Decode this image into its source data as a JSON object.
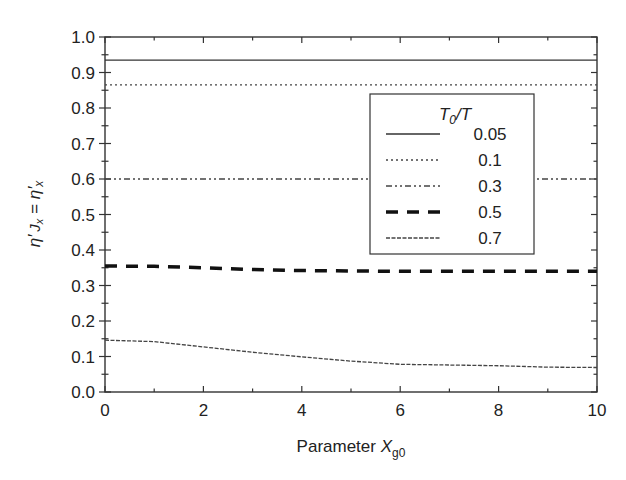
{
  "chart_data": {
    "type": "line",
    "title": "",
    "xlabel": "Parameter X_g0",
    "xlabel_main": "Parameter ",
    "xlabel_var": "X",
    "xlabel_sub": "g0",
    "ylabel": "η′_Jx = η′_x",
    "xlim": [
      0,
      10
    ],
    "ylim": [
      0.0,
      1.0
    ],
    "xticks": [
      0,
      2,
      4,
      6,
      8,
      10
    ],
    "xtick_labels": [
      "0",
      "2",
      "4",
      "6",
      "8",
      "10"
    ],
    "yticks": [
      0.0,
      0.1,
      0.2,
      0.3,
      0.4,
      0.5,
      0.6,
      0.7,
      0.8,
      0.9,
      1.0
    ],
    "ytick_labels": [
      "0.0",
      "0.1",
      "0.2",
      "0.3",
      "0.4",
      "0.5",
      "0.6",
      "0.7",
      "0.8",
      "0.9",
      "1.0"
    ],
    "grid": false,
    "legend_title": "T0/T",
    "legend_position": "upper right (inside)",
    "x": [
      0,
      1,
      2,
      3,
      4,
      5,
      6,
      7,
      8,
      9,
      10
    ],
    "series": [
      {
        "name": "0.05",
        "style": "solid",
        "values": [
          0.935,
          0.935,
          0.935,
          0.935,
          0.935,
          0.935,
          0.935,
          0.935,
          0.935,
          0.935,
          0.935
        ]
      },
      {
        "name": "0.1",
        "style": "dotted",
        "values": [
          0.865,
          0.865,
          0.865,
          0.865,
          0.865,
          0.865,
          0.865,
          0.865,
          0.865,
          0.865,
          0.865
        ]
      },
      {
        "name": "0.3",
        "style": "dash-dot-dot",
        "values": [
          0.6,
          0.6,
          0.6,
          0.6,
          0.6,
          0.6,
          0.6,
          0.6,
          0.6,
          0.6,
          0.6
        ]
      },
      {
        "name": "0.5",
        "style": "thick-dashed",
        "values": [
          0.355,
          0.354,
          0.35,
          0.345,
          0.342,
          0.341,
          0.34,
          0.34,
          0.34,
          0.34,
          0.34
        ]
      },
      {
        "name": "0.7",
        "style": "fine-dashed",
        "values": [
          0.146,
          0.142,
          0.127,
          0.112,
          0.099,
          0.087,
          0.078,
          0.076,
          0.074,
          0.07,
          0.069
        ]
      }
    ]
  }
}
